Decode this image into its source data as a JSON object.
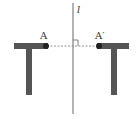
{
  "diagram": {
    "type": "reflection",
    "axis": {
      "label": "l",
      "x": 73,
      "y1": 3,
      "y2": 114,
      "color": "#555555"
    },
    "segment": {
      "from": "A",
      "to": "A'",
      "y": 46,
      "style": "dashed",
      "perpendicular_marker": true
    },
    "points": [
      {
        "label": "A",
        "x": 47,
        "y": 46
      },
      {
        "label": "A′",
        "x": 99,
        "y": 46
      }
    ],
    "shapes": [
      {
        "name": "left-T",
        "color": "#555555"
      },
      {
        "name": "right-T",
        "color": "#555555"
      }
    ]
  }
}
